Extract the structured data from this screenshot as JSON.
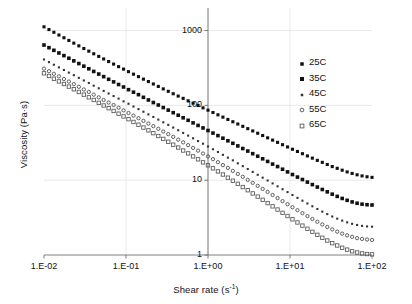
{
  "chart_data": {
    "type": "scatter",
    "title": "",
    "xlabel": "Shear rate (s-1)",
    "xlabel_base": "Shear rate (s",
    "xlabel_exp": "-1",
    "xlabel_tail": ")",
    "ylabel": "Viscosity (Pa·s)",
    "xscale": "log",
    "yscale": "log",
    "xlim": [
      0.01,
      100
    ],
    "ylim": [
      1,
      2000
    ],
    "grid": true,
    "legend_position": "upper-right-inside",
    "xticks": [
      "1.E-02",
      "1.E-01",
      "1.E+00",
      "1.E+01",
      "1.E+02"
    ],
    "xtick_values": [
      0.01,
      0.1,
      1,
      10,
      100
    ],
    "yticks": [
      "1000",
      "100",
      "10",
      "1"
    ],
    "ytick_values": [
      1000,
      100,
      10,
      1
    ],
    "series": [
      {
        "name": "25C",
        "marker": "filled-square",
        "color": "#111111",
        "size": 3.1,
        "x": [
          0.01,
          0.0115,
          0.0132,
          0.0152,
          0.0175,
          0.0201,
          0.0231,
          0.0266,
          0.0306,
          0.0352,
          0.0404,
          0.0465,
          0.0534,
          0.0614,
          0.0706,
          0.0812,
          0.0933,
          0.1073,
          0.1234,
          0.1419,
          0.1631,
          0.1875,
          0.2155,
          0.2477,
          0.2848,
          0.3275,
          0.3765,
          0.4329,
          0.4977,
          0.5722,
          0.6579,
          0.7564,
          0.8697,
          1.0,
          1.1498,
          1.3219,
          1.5199,
          1.7475,
          2.0092,
          2.3101,
          2.6561,
          3.0539,
          3.5112,
          4.037,
          4.6416,
          5.3367,
          6.1359,
          7.0548,
          8.1113,
          9.326,
          10.7227,
          12.3285,
          14.1747,
          16.2975,
          18.7382,
          21.5443,
          24.7708,
          28.4804,
          32.7455,
          37.6494,
          43.2876,
          49.7702,
          57.2237,
          65.7933,
          75.6463,
          86.9749,
          100.0
        ],
        "y": [
          1120,
          1030,
          947,
          871,
          801,
          737,
          678,
          624,
          575,
          530,
          489,
          451,
          417,
          385,
          356,
          329,
          305,
          282,
          261,
          242,
          224,
          208,
          193,
          179,
          166,
          154,
          143,
          133,
          124,
          115,
          107,
          99.5,
          92.6,
          86.2,
          80.2,
          74.7,
          69.6,
          64.8,
          60.4,
          56.3,
          52.4,
          48.8,
          45.5,
          42.4,
          39.5,
          36.8,
          34.3,
          32.0,
          29.8,
          27.8,
          25.9,
          24.2,
          22.6,
          21.1,
          19.7,
          18.4,
          17.3,
          16.2,
          15.2,
          14.4,
          13.6,
          12.9,
          12.3,
          11.8,
          11.4,
          11.1,
          10.9
        ]
      },
      {
        "name": "35C",
        "marker": "filled-square",
        "color": "#111111",
        "size": 3.6,
        "x": [
          0.01,
          0.0115,
          0.0132,
          0.0152,
          0.0175,
          0.0201,
          0.0231,
          0.0266,
          0.0306,
          0.0352,
          0.0404,
          0.0465,
          0.0534,
          0.0614,
          0.0706,
          0.0812,
          0.0933,
          0.1073,
          0.1234,
          0.1419,
          0.1631,
          0.1875,
          0.2155,
          0.2477,
          0.2848,
          0.3275,
          0.3765,
          0.4329,
          0.4977,
          0.5722,
          0.6579,
          0.7564,
          0.8697,
          1.0,
          1.1498,
          1.3219,
          1.5199,
          1.7475,
          2.0092,
          2.3101,
          2.6561,
          3.0539,
          3.5112,
          4.037,
          4.6416,
          5.3367,
          6.1359,
          7.0548,
          8.1113,
          9.326,
          10.7227,
          12.3285,
          14.1747,
          16.2975,
          18.7382,
          21.5443,
          24.7708,
          28.4804,
          32.7455,
          37.6494,
          43.2876,
          49.7702,
          57.2237,
          65.7933,
          75.6463,
          86.9749,
          100.0
        ],
        "y": [
          640,
          590,
          544,
          501,
          462,
          426,
          393,
          362,
          334,
          308,
          284,
          262,
          242,
          223,
          206,
          190,
          176,
          162,
          150,
          139,
          128,
          118,
          109,
          101,
          93.4,
          86.3,
          79.8,
          73.8,
          68.2,
          63.1,
          58.3,
          53.9,
          49.9,
          46.1,
          42.6,
          39.4,
          36.4,
          33.6,
          31.1,
          28.7,
          26.5,
          24.5,
          22.6,
          20.9,
          19.3,
          17.8,
          16.4,
          15.2,
          14.0,
          12.9,
          11.9,
          11.0,
          10.2,
          9.42,
          8.73,
          8.09,
          7.51,
          6.98,
          6.5,
          6.07,
          5.7,
          5.38,
          5.12,
          4.92,
          4.78,
          4.7,
          4.66
        ]
      },
      {
        "name": "45C",
        "marker": "small-dot",
        "color": "#333333",
        "size": 2.1,
        "x": [
          0.01,
          0.0115,
          0.0132,
          0.0152,
          0.0175,
          0.0201,
          0.0231,
          0.0266,
          0.0306,
          0.0352,
          0.0404,
          0.0465,
          0.0534,
          0.0614,
          0.0706,
          0.0812,
          0.0933,
          0.1073,
          0.1234,
          0.1419,
          0.1631,
          0.1875,
          0.2155,
          0.2477,
          0.2848,
          0.3275,
          0.3765,
          0.4329,
          0.4977,
          0.5722,
          0.6579,
          0.7564,
          0.8697,
          1.0,
          1.1498,
          1.3219,
          1.5199,
          1.7475,
          2.0092,
          2.3101,
          2.6561,
          3.0539,
          3.5112,
          4.037,
          4.6416,
          5.3367,
          6.1359,
          7.0548,
          8.1113,
          9.326,
          10.7227,
          12.3285,
          14.1747,
          16.2975,
          18.7382,
          21.5443,
          24.7708,
          28.4804,
          32.7455,
          37.6494,
          43.2876,
          49.7702,
          57.2237,
          65.7933,
          75.6463,
          86.9749,
          100.0
        ],
        "y": [
          410,
          378,
          349,
          322,
          297,
          274,
          253,
          233,
          215,
          199,
          183,
          169,
          156,
          144,
          133,
          123,
          113,
          105,
          96.5,
          89.1,
          82.2,
          75.8,
          69.9,
          64.5,
          59.4,
          54.8,
          50.5,
          46.5,
          42.8,
          39.4,
          36.3,
          33.3,
          30.7,
          28.2,
          25.9,
          23.8,
          21.8,
          20.0,
          18.4,
          16.8,
          15.4,
          14.1,
          12.9,
          11.8,
          10.8,
          9.9,
          9.05,
          8.28,
          7.57,
          6.93,
          6.34,
          5.8,
          5.32,
          4.88,
          4.48,
          4.12,
          3.8,
          3.52,
          3.27,
          3.06,
          2.88,
          2.73,
          2.61,
          2.52,
          2.45,
          2.41,
          2.39
        ]
      },
      {
        "name": "55C",
        "marker": "open-circle",
        "color": "#444444",
        "size": 3.3,
        "x": [
          0.01,
          0.0115,
          0.0132,
          0.0152,
          0.0175,
          0.0201,
          0.0231,
          0.0266,
          0.0306,
          0.0352,
          0.0404,
          0.0465,
          0.0534,
          0.0614,
          0.0706,
          0.0812,
          0.0933,
          0.1073,
          0.1234,
          0.1419,
          0.1631,
          0.1875,
          0.2155,
          0.2477,
          0.2848,
          0.3275,
          0.3765,
          0.4329,
          0.4977,
          0.5722,
          0.6579,
          0.7564,
          0.8697,
          1.0,
          1.1498,
          1.3219,
          1.5199,
          1.7475,
          2.0092,
          2.3101,
          2.6561,
          3.0539,
          3.5112,
          4.037,
          4.6416,
          5.3367,
          6.1359,
          7.0548,
          8.1113,
          9.326,
          10.7227,
          12.3285,
          14.1747,
          16.2975,
          18.7382,
          21.5443,
          24.7708,
          28.4804,
          32.7455,
          37.6494,
          43.2876,
          49.7702,
          57.2237,
          65.7933,
          75.6463,
          86.9749,
          100.0
        ],
        "y": [
          310,
          286,
          264,
          244,
          225,
          208,
          192,
          177,
          163,
          151,
          139,
          128,
          118,
          109,
          101,
          92.9,
          85.7,
          79.1,
          73.0,
          67.3,
          62.1,
          57.2,
          52.7,
          48.6,
          44.7,
          41.2,
          37.9,
          34.8,
          32.0,
          29.4,
          27.0,
          24.8,
          22.7,
          20.8,
          19.1,
          17.4,
          15.9,
          14.6,
          13.3,
          12.1,
          11.1,
          10.1,
          9.21,
          8.39,
          7.64,
          6.96,
          6.33,
          5.76,
          5.25,
          4.78,
          4.35,
          3.97,
          3.62,
          3.31,
          3.03,
          2.78,
          2.56,
          2.37,
          2.2,
          2.05,
          1.93,
          1.83,
          1.75,
          1.68,
          1.64,
          1.61,
          1.59
        ]
      },
      {
        "name": "65C",
        "marker": "open-square",
        "color": "#555555",
        "size": 3.4,
        "x": [
          0.01,
          0.0115,
          0.0132,
          0.0152,
          0.0175,
          0.0201,
          0.0231,
          0.0266,
          0.0306,
          0.0352,
          0.0404,
          0.0465,
          0.0534,
          0.0614,
          0.0706,
          0.0812,
          0.0933,
          0.1073,
          0.1234,
          0.1419,
          0.1631,
          0.1875,
          0.2155,
          0.2477,
          0.2848,
          0.3275,
          0.3765,
          0.4329,
          0.4977,
          0.5722,
          0.6579,
          0.7564,
          0.8697,
          1.0,
          1.1498,
          1.3219,
          1.5199,
          1.7475,
          2.0092,
          2.3101,
          2.6561,
          3.0539,
          3.5112,
          4.037,
          4.6416,
          5.3367,
          6.1359,
          7.0548,
          8.1113,
          9.326,
          10.7227,
          12.3285,
          14.1747,
          16.2975,
          18.7382,
          21.5443,
          24.7708,
          28.4804,
          32.7455,
          37.6494,
          43.2876,
          49.7702,
          57.2237,
          65.7933,
          75.6463,
          86.9749,
          100.0
        ],
        "y": [
          268,
          247,
          227,
          209,
          193,
          178,
          164,
          151,
          139,
          128,
          118,
          108,
          99.6,
          91.6,
          84.2,
          77.4,
          71.1,
          65.3,
          60.0,
          55.1,
          50.5,
          46.3,
          42.5,
          38.9,
          35.6,
          32.6,
          29.8,
          27.3,
          24.9,
          22.8,
          20.8,
          19.0,
          17.3,
          15.8,
          14.4,
          13.1,
          11.9,
          10.8,
          9.84,
          8.93,
          8.1,
          7.34,
          6.65,
          6.03,
          5.46,
          4.94,
          4.47,
          4.05,
          3.66,
          3.32,
          3.0,
          2.72,
          2.47,
          2.24,
          2.04,
          1.86,
          1.7,
          1.56,
          1.44,
          1.34,
          1.25,
          1.18,
          1.12,
          1.08,
          1.05,
          1.03,
          1.02
        ]
      }
    ]
  },
  "legend": {
    "items": [
      {
        "label": "25C"
      },
      {
        "label": "35C"
      },
      {
        "label": "45C"
      },
      {
        "label": "55C"
      },
      {
        "label": "65C"
      }
    ]
  }
}
